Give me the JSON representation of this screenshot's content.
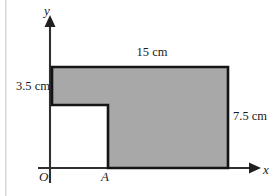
{
  "figure": {
    "type": "geometry-diagram",
    "colors": {
      "fill": "#a8a8a8",
      "stroke": "#141414",
      "axis": "#303030",
      "background": "#ffffff"
    },
    "axes": {
      "x_label": "x",
      "y_label": "y",
      "origin_label": "O"
    },
    "points": {
      "a_label": "A"
    },
    "dimensions": {
      "top": "15 cm",
      "left": "3.5 cm",
      "right": "7.5 cm"
    },
    "geometry": {
      "outer_rect": {
        "x1": 52,
        "y1": 67,
        "x2": 228,
        "y2": 168
      },
      "notch_rect": {
        "x1": 52,
        "y1": 105,
        "x2": 108,
        "y2": 168
      },
      "polygon_points": "52,67 228,67 228,168 108,168 108,105 52,105",
      "x_axis": {
        "x1": 38,
        "y1": 168,
        "x2": 250,
        "y2": 168
      },
      "y_axis": {
        "x1": 50,
        "y1": 182,
        "x2": 50,
        "y2": 24
      }
    }
  }
}
